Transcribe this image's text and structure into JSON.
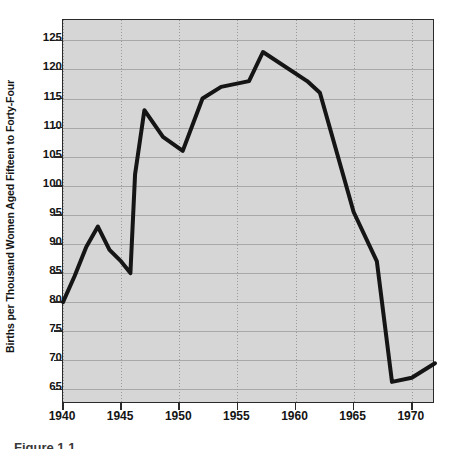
{
  "chart_data": {
    "type": "line",
    "title": "",
    "xlabel": "",
    "ylabel": "Births per Thousand Women Aged Fifteen to Forty-Four",
    "xlim": [
      1940,
      1972
    ],
    "ylim": [
      62.5,
      128.5
    ],
    "xticks": [
      1940,
      1945,
      1950,
      1955,
      1960,
      1965,
      1970
    ],
    "xticklabels": [
      "1940",
      "1945",
      "1950",
      "1955",
      "1960",
      "1965",
      "1970"
    ],
    "yticks": [
      65,
      70,
      75,
      80,
      85,
      90,
      95,
      100,
      105,
      110,
      115,
      120,
      125
    ],
    "yticklabels": [
      "65",
      "70",
      "75",
      "80",
      "85",
      "90",
      "95",
      "100",
      "105",
      "110",
      "115",
      "120",
      "125"
    ],
    "grid": true,
    "grid_style": "horizontal solid, vertical dotted",
    "legend": "none",
    "line_color": "#151515",
    "line_width": 4,
    "plot_background": "#d6d6d6",
    "figure_background": "#ffffff",
    "series": [
      {
        "name": "General Fertility Rate",
        "x": [
          1940,
          1941,
          1942,
          1943,
          1944,
          1945,
          1945.8,
          1946.2,
          1947,
          1948.6,
          1950.3,
          1952,
          1953.6,
          1956,
          1957.2,
          1961,
          1962.1,
          1965,
          1967,
          1968.3,
          1970,
          1972
        ],
        "values": [
          80,
          84.5,
          89.5,
          93,
          89,
          87,
          85,
          102,
          113,
          108.4,
          106,
          115,
          117,
          118,
          123,
          118,
          116,
          95.5,
          87,
          66.3,
          67,
          69.5
        ]
      }
    ]
  },
  "caption": {
    "text": "Figure 1.1"
  }
}
